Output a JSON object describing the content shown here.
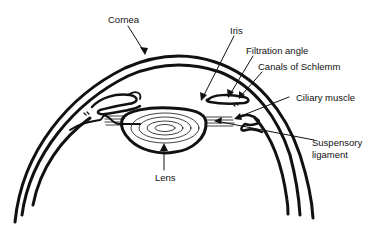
{
  "diagram": {
    "labels": {
      "cornea": "Cornea",
      "iris": "Iris",
      "filtration_angle": "Filtration angle",
      "canals_of_schlemm": "Canals of Schlemm",
      "ciliary_muscle": "Ciliary muscle",
      "suspensory_ligament_line1": "Suspensory",
      "suspensory_ligament_line2": "ligament",
      "lens": "Lens"
    },
    "colors": {
      "stroke": "#111111",
      "background": "#ffffff"
    }
  }
}
